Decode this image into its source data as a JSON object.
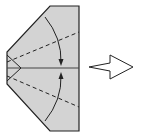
{
  "diagram": {
    "type": "origami-fold-step",
    "paper_color": "#d3d3d3",
    "line_color": "#222222",
    "elements": [
      {
        "name": "paper-shape",
        "kind": "folded paper"
      },
      {
        "name": "center-crease",
        "kind": "solid line"
      },
      {
        "name": "upper-valley-fold",
        "kind": "dashed line"
      },
      {
        "name": "lower-valley-fold",
        "kind": "dashed line"
      },
      {
        "name": "upper-fold-arrow",
        "kind": "curved arrow"
      },
      {
        "name": "lower-fold-arrow",
        "kind": "curved arrow"
      },
      {
        "name": "next-step-arrow",
        "kind": "hollow arrow"
      }
    ]
  }
}
